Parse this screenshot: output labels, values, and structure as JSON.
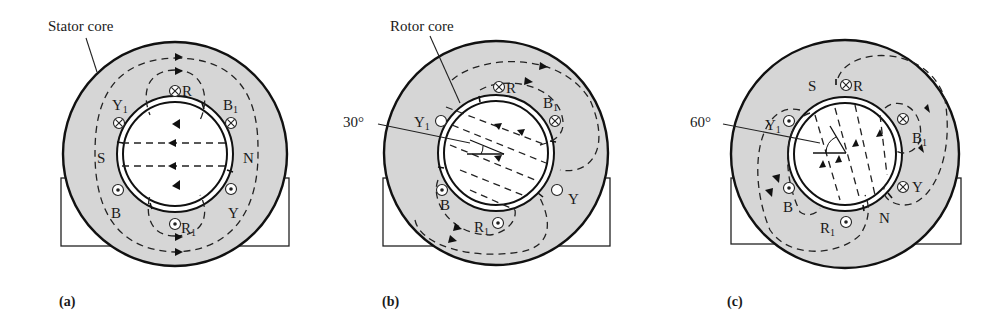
{
  "figure": {
    "panels": [
      {
        "id": "a",
        "caption": "(a)",
        "callout": "Stator core",
        "angle_label": "",
        "poles": {
          "S": "S",
          "N": "N"
        },
        "conductors": [
          {
            "label": "R",
            "sub": "",
            "symbol": "cross"
          },
          {
            "label": "B",
            "sub": "1",
            "symbol": "cross"
          },
          {
            "label": "Y",
            "sub": "",
            "symbol": "dot"
          },
          {
            "label": "R",
            "sub": "1",
            "symbol": "dot"
          },
          {
            "label": "B",
            "sub": "",
            "symbol": "dot"
          },
          {
            "label": "Y",
            "sub": "1",
            "symbol": "cross"
          }
        ]
      },
      {
        "id": "b",
        "caption": "(b)",
        "callout": "Rotor core",
        "angle_label": "30°",
        "poles": {
          "S": "",
          "N": ""
        },
        "conductors": [
          {
            "label": "R",
            "sub": "",
            "symbol": "cross"
          },
          {
            "label": "B",
            "sub": "1",
            "symbol": "cross"
          },
          {
            "label": "Y",
            "sub": "",
            "symbol": "empty"
          },
          {
            "label": "R",
            "sub": "1",
            "symbol": "dot"
          },
          {
            "label": "B",
            "sub": "",
            "symbol": "dot"
          },
          {
            "label": "Y",
            "sub": "1",
            "symbol": "empty"
          }
        ]
      },
      {
        "id": "c",
        "caption": "(c)",
        "callout": "",
        "angle_label": "60°",
        "poles": {
          "S": "S",
          "N": "N"
        },
        "conductors": [
          {
            "label": "R",
            "sub": "",
            "symbol": "cross"
          },
          {
            "label": "B",
            "sub": "1",
            "symbol": "cross"
          },
          {
            "label": "Y",
            "sub": "",
            "symbol": "cross"
          },
          {
            "label": "R",
            "sub": "1",
            "symbol": "dot"
          },
          {
            "label": "B",
            "sub": "",
            "symbol": "dot"
          },
          {
            "label": "Y",
            "sub": "1",
            "symbol": "dot"
          }
        ]
      }
    ],
    "colors": {
      "core": "#d6d6d6",
      "line": "#111111",
      "background": "#ffffff"
    }
  }
}
